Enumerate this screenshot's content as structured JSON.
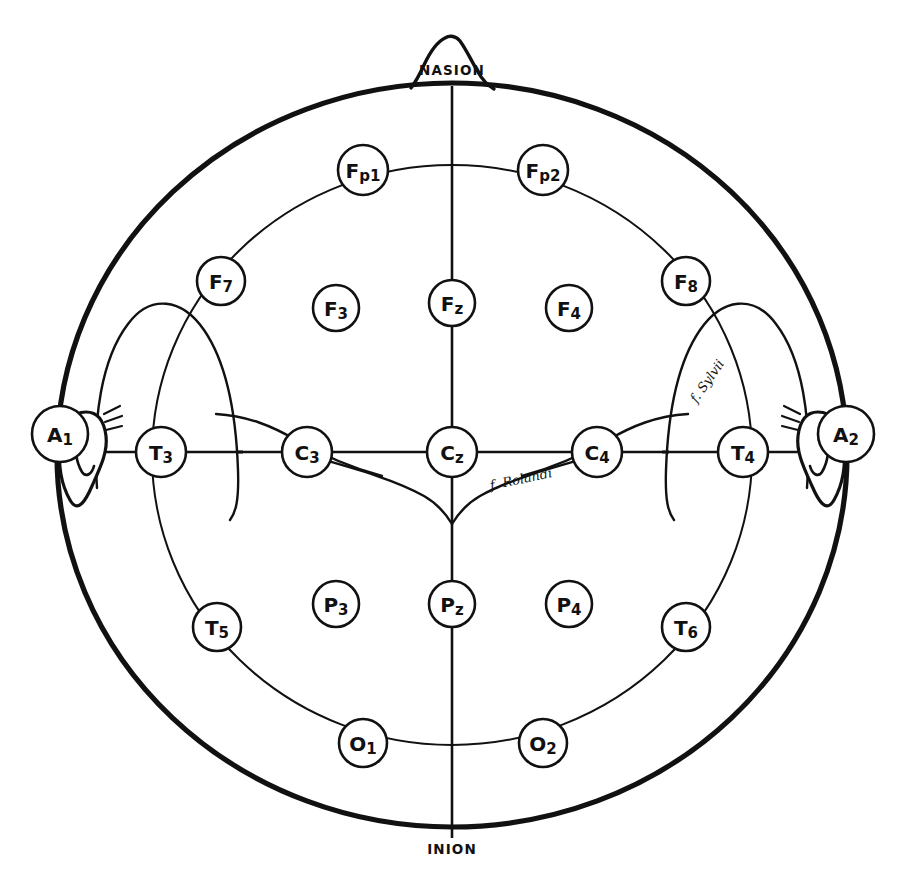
{
  "diagram": {
    "view": "top-down head map",
    "background_color": "#ffffff",
    "ink_color": "#111111"
  },
  "landmarks": {
    "nasion": {
      "label": "NASION",
      "x": 452,
      "y": 70
    },
    "inion": {
      "label": "INION",
      "x": 452,
      "y": 849
    }
  },
  "ears": {
    "left": {
      "label": "A1",
      "main": "A",
      "sub": "1",
      "cx": 60,
      "cy": 434,
      "r": 28
    },
    "right": {
      "label": "A2",
      "main": "A",
      "sub": "2",
      "cx": 846,
      "cy": 434,
      "r": 28
    }
  },
  "fissure_labels": {
    "rolandic": {
      "text": "f. Rolandi",
      "x": 521,
      "y": 479,
      "rotation": -12
    },
    "sylvian": {
      "text": "f. Sylvii",
      "x": 707,
      "y": 381,
      "rotation": -55
    }
  },
  "electrodes": [
    {
      "name": "Fp1",
      "main": "F",
      "sub": "p1",
      "cx": 363,
      "cy": 170,
      "r": 25,
      "region": "frontopolar",
      "side": "left"
    },
    {
      "name": "Fp2",
      "main": "F",
      "sub": "p2",
      "cx": 543,
      "cy": 170,
      "r": 25,
      "region": "frontopolar",
      "side": "right"
    },
    {
      "name": "F7",
      "main": "F",
      "sub": "7",
      "cx": 221,
      "cy": 281,
      "r": 24,
      "region": "frontal-temporal",
      "side": "left"
    },
    {
      "name": "F3",
      "main": "F",
      "sub": "3",
      "cx": 336,
      "cy": 308,
      "r": 23,
      "region": "frontal",
      "side": "left"
    },
    {
      "name": "Fz",
      "main": "F",
      "sub": "z",
      "cx": 452,
      "cy": 303,
      "r": 23,
      "region": "frontal-midline",
      "side": "midline"
    },
    {
      "name": "F4",
      "main": "F",
      "sub": "4",
      "cx": 569,
      "cy": 308,
      "r": 23,
      "region": "frontal",
      "side": "right"
    },
    {
      "name": "F8",
      "main": "F",
      "sub": "8",
      "cx": 686,
      "cy": 281,
      "r": 24,
      "region": "frontal-temporal",
      "side": "right"
    },
    {
      "name": "T3",
      "main": "T",
      "sub": "3",
      "cx": 161,
      "cy": 452,
      "r": 25,
      "region": "temporal",
      "side": "left"
    },
    {
      "name": "C3",
      "main": "C",
      "sub": "3",
      "cx": 307,
      "cy": 452,
      "r": 25,
      "region": "central",
      "side": "left"
    },
    {
      "name": "Cz",
      "main": "C",
      "sub": "z",
      "cx": 452,
      "cy": 452,
      "r": 25,
      "region": "central-vertex",
      "side": "midline"
    },
    {
      "name": "C4",
      "main": "C",
      "sub": "4",
      "cx": 597,
      "cy": 452,
      "r": 25,
      "region": "central",
      "side": "right"
    },
    {
      "name": "T4",
      "main": "T",
      "sub": "4",
      "cx": 743,
      "cy": 452,
      "r": 25,
      "region": "temporal",
      "side": "right"
    },
    {
      "name": "T5",
      "main": "T",
      "sub": "5",
      "cx": 217,
      "cy": 627,
      "r": 24,
      "region": "posterior-temporal",
      "side": "left"
    },
    {
      "name": "P3",
      "main": "P",
      "sub": "3",
      "cx": 336,
      "cy": 604,
      "r": 23,
      "region": "parietal",
      "side": "left"
    },
    {
      "name": "Pz",
      "main": "P",
      "sub": "z",
      "cx": 452,
      "cy": 604,
      "r": 23,
      "region": "parietal-midline",
      "side": "midline"
    },
    {
      "name": "P4",
      "main": "P",
      "sub": "4",
      "cx": 569,
      "cy": 604,
      "r": 23,
      "region": "parietal",
      "side": "right"
    },
    {
      "name": "T6",
      "main": "T",
      "sub": "6",
      "cx": 686,
      "cy": 627,
      "r": 24,
      "region": "posterior-temporal",
      "side": "right"
    },
    {
      "name": "O1",
      "main": "O",
      "sub": "1",
      "cx": 363,
      "cy": 743,
      "r": 24,
      "region": "occipital",
      "side": "left"
    },
    {
      "name": "O2",
      "main": "O",
      "sub": "2",
      "cx": 543,
      "cy": 743,
      "r": 24,
      "region": "occipital",
      "side": "right"
    }
  ]
}
